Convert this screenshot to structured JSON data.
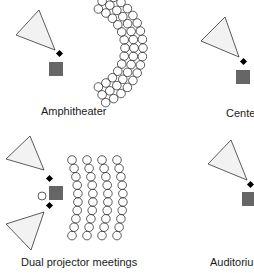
{
  "diagram": {
    "colors": {
      "screen_stroke": "#333333",
      "screen_fill": "#f2f2f2",
      "projector_fill": "#666666",
      "speaker_fill": "#000000",
      "seat_stroke": "#333333"
    },
    "layouts": [
      {
        "id": "amphitheater",
        "label": "Amphitheater",
        "seats": "curved arc, 3 rows"
      },
      {
        "id": "center",
        "label": "Center",
        "seats": "none shown"
      },
      {
        "id": "dual-projector",
        "label": "Dual projector meetings",
        "seats": "4 columns x 10"
      },
      {
        "id": "auditorium",
        "label": "Auditorium",
        "seats": "none shown"
      }
    ]
  }
}
